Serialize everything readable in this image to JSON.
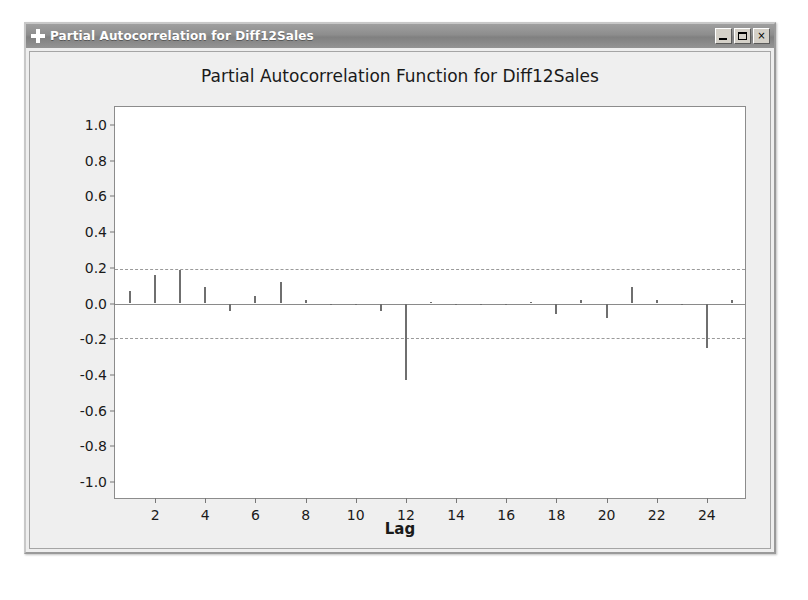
{
  "window": {
    "title": "Partial Autocorrelation for Diff12Sales",
    "system_icon": "plus-icon",
    "buttons": {
      "minimize": "_",
      "maximize": "maximize-icon",
      "close": "×"
    }
  },
  "chart_data": {
    "type": "bar",
    "title": "Partial Autocorrelation Function for Diff12Sales",
    "xlabel": "Lag",
    "ylabel": "Partial Autocorrelation",
    "xlim": [
      0.4,
      25.6
    ],
    "ylim": [
      -1.1,
      1.1
    ],
    "ytick_labels": [
      "1.0",
      "0.8",
      "0.6",
      "0.4",
      "0.2",
      "0.0",
      "-0.2",
      "-0.4",
      "-0.6",
      "-0.8",
      "-1.0"
    ],
    "ytick_values": [
      1.0,
      0.8,
      0.6,
      0.4,
      0.2,
      0.0,
      -0.2,
      -0.4,
      -0.6,
      -0.8,
      -1.0
    ],
    "xtick_labels": [
      "2",
      "4",
      "6",
      "8",
      "10",
      "12",
      "14",
      "16",
      "18",
      "20",
      "22",
      "24"
    ],
    "xtick_values": [
      2,
      4,
      6,
      8,
      10,
      12,
      14,
      16,
      18,
      20,
      22,
      24
    ],
    "grid": false,
    "legend": null,
    "significance_limits": [
      0.195,
      -0.195
    ],
    "categories": [
      1,
      2,
      3,
      4,
      5,
      6,
      7,
      8,
      9,
      10,
      11,
      12,
      13,
      14,
      15,
      16,
      17,
      18,
      19,
      20,
      21,
      22,
      23,
      24,
      25
    ],
    "values": [
      0.07,
      0.16,
      0.19,
      0.09,
      -0.04,
      0.04,
      0.12,
      0.02,
      0.0,
      -0.01,
      -0.04,
      -0.43,
      0.01,
      0.0,
      -0.01,
      -0.01,
      0.01,
      -0.06,
      0.02,
      -0.08,
      0.09,
      0.02,
      -0.01,
      -0.25,
      0.02
    ],
    "series_name": "PACF"
  }
}
